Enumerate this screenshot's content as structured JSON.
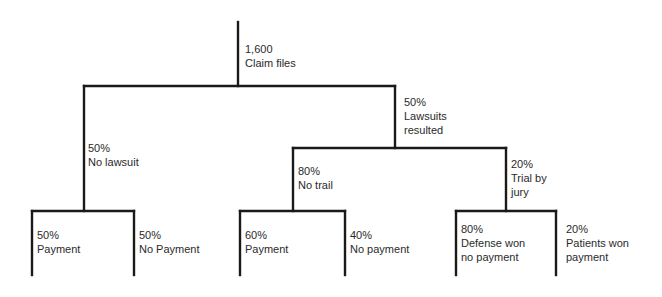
{
  "tree": {
    "root": {
      "pct": "1,600",
      "label": "Claim files"
    },
    "level1": [
      {
        "pct": "50%",
        "label": "No lawsuit"
      },
      {
        "pct": "50%",
        "label_line1": "Lawsuits",
        "label_line2": "resulted"
      }
    ],
    "level2": [
      {
        "pct": "80%",
        "label": "No trail"
      },
      {
        "pct": "20%",
        "label_line1": "Trial by",
        "label_line2": "jury"
      }
    ],
    "leaves": [
      {
        "pct": "50%",
        "label": "Payment"
      },
      {
        "pct": "50%",
        "label": "No Payment"
      },
      {
        "pct": "60%",
        "label": "Payment"
      },
      {
        "pct": "40%",
        "label": "No payment"
      },
      {
        "pct": "80%",
        "label_line1": "Defense won",
        "label_line2": "no payment"
      },
      {
        "pct": "20%",
        "label_line1": "Patients won",
        "label_line2": "payment"
      }
    ]
  },
  "colors": {
    "line": "#1a1a1a",
    "text": "#2a2a2a",
    "background": "#ffffff"
  }
}
